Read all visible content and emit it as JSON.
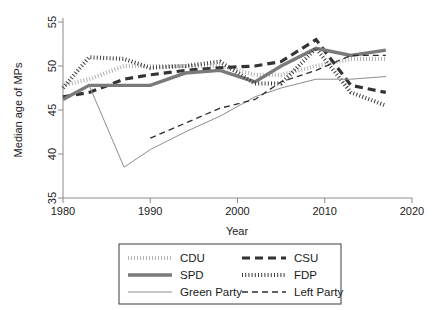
{
  "chart_data": {
    "type": "line",
    "title": "",
    "xlabel": "Year",
    "ylabel": "Median age of MPs",
    "xlim": [
      1980,
      2020
    ],
    "ylim": [
      35,
      55
    ],
    "xticks": [
      1980,
      1990,
      2000,
      2010,
      2020
    ],
    "yticks": [
      35,
      40,
      45,
      50,
      55
    ],
    "grid": false,
    "legend_position": "below-center",
    "series": [
      {
        "name": "CDU",
        "color": "#b3b3b3",
        "width": 4.2,
        "dash": "1,2",
        "x": [
          1980,
          1983,
          1987,
          1990,
          1994,
          1998,
          2002,
          2005,
          2009,
          2013,
          2017
        ],
        "y": [
          47.8,
          48.5,
          50.0,
          50.0,
          50.0,
          50.0,
          49.0,
          49.0,
          50.0,
          50.8,
          50.8
        ]
      },
      {
        "name": "CSU",
        "color": "#333333",
        "width": 3.2,
        "dash": "8,5",
        "x": [
          1980,
          1983,
          1987,
          1990,
          1994,
          1998,
          2002,
          2005,
          2009,
          2013,
          2017
        ],
        "y": [
          46.5,
          47.0,
          48.5,
          49.0,
          49.5,
          49.8,
          50.0,
          50.5,
          53.0,
          47.8,
          47.0
        ]
      },
      {
        "name": "SPD",
        "color": "#7a7a7a",
        "width": 3.4,
        "dash": "none",
        "x": [
          1980,
          1983,
          1987,
          1990,
          1994,
          1998,
          2002,
          2005,
          2009,
          2013,
          2017
        ],
        "y": [
          46.2,
          47.8,
          47.8,
          47.8,
          49.2,
          49.5,
          48.2,
          50.0,
          52.0,
          51.2,
          51.8
        ]
      },
      {
        "name": "FDP",
        "color": "#3d3d3d",
        "width": 4.0,
        "dash": "1,2.2",
        "x": [
          1980,
          1983,
          1987,
          1990,
          1994,
          1998,
          2002,
          2005,
          2009,
          2013,
          2017
        ],
        "y": [
          47.5,
          51.0,
          50.8,
          49.8,
          50.0,
          50.5,
          48.0,
          48.0,
          52.0,
          47.0,
          45.5
        ]
      },
      {
        "name": "Green Party",
        "color": "#8e8e8e",
        "width": 1.0,
        "dash": "none",
        "x": [
          1983,
          1987,
          1990,
          1994,
          1998,
          2002,
          2005,
          2009,
          2013,
          2017
        ],
        "y": [
          47.8,
          38.5,
          40.5,
          42.5,
          44.3,
          46.5,
          47.5,
          48.5,
          48.5,
          48.8
        ]
      },
      {
        "name": "Left Party",
        "color": "#2e2e2e",
        "width": 1.3,
        "dash": "6,4",
        "x": [
          1990,
          1994,
          1998,
          2002,
          2005,
          2009,
          2013,
          2017
        ],
        "y": [
          41.8,
          43.5,
          45.2,
          46.2,
          48.2,
          49.5,
          51.2,
          51.2
        ]
      }
    ],
    "legend": [
      {
        "label": "CDU",
        "column": 0,
        "row": 0
      },
      {
        "label": "SPD",
        "column": 0,
        "row": 1
      },
      {
        "label": "Green Party",
        "column": 0,
        "row": 2
      },
      {
        "label": "CSU",
        "column": 1,
        "row": 0
      },
      {
        "label": "FDP",
        "column": 1,
        "row": 1
      },
      {
        "label": "Left Party",
        "column": 1,
        "row": 2
      }
    ]
  }
}
